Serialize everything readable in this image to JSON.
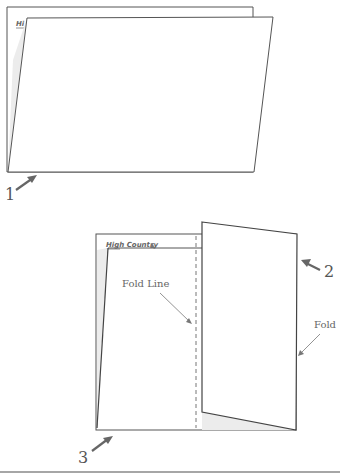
{
  "figure": {
    "colors": {
      "outline": "#555555",
      "shade": "#ececec",
      "arrow": "#666666",
      "text": "#555555",
      "rule": "#888888"
    },
    "top_diagram": {
      "header_text": "Hi",
      "step_label": "1"
    },
    "bottom_diagram": {
      "header_text": "High Country",
      "header_glyph": "▲",
      "fold_line_label": "Fold Line",
      "fold_label": "Fold",
      "step_labels": [
        "2",
        "3"
      ]
    }
  }
}
